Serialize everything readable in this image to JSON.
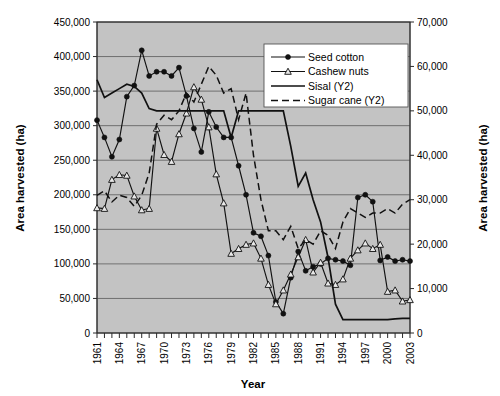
{
  "chart_data": {
    "type": "line",
    "title": "",
    "xlabel": "Year",
    "ylabel": "Area harvested (ha)",
    "y2label": "Area harvested (ha)",
    "ylim": [
      0,
      450000
    ],
    "y2lim": [
      0,
      70000
    ],
    "yticks": [
      "0",
      "50,000",
      "100,000",
      "150,000",
      "200,000",
      "250,000",
      "300,000",
      "350,000",
      "400,000",
      "450,000"
    ],
    "ytick_values": [
      0,
      50000,
      100000,
      150000,
      200000,
      250000,
      300000,
      350000,
      400000,
      450000
    ],
    "y2ticks": [
      "0",
      "10,000",
      "20,000",
      "30,000",
      "40,000",
      "50,000",
      "60,000",
      "70,000"
    ],
    "y2tick_values": [
      0,
      10000,
      20000,
      30000,
      40000,
      50000,
      60000,
      70000
    ],
    "grid": true,
    "legend_position": "top-right",
    "xlim": [
      1961,
      2003
    ],
    "x": [
      1961,
      1962,
      1963,
      1964,
      1965,
      1966,
      1967,
      1968,
      1969,
      1970,
      1971,
      1972,
      1973,
      1974,
      1975,
      1976,
      1977,
      1978,
      1979,
      1980,
      1981,
      1982,
      1983,
      1984,
      1985,
      1986,
      1987,
      1988,
      1989,
      1990,
      1991,
      1992,
      1993,
      1994,
      1995,
      1996,
      1997,
      1998,
      1999,
      2000,
      2001,
      2002,
      2003
    ],
    "xtick_labels": [
      "1961",
      "1964",
      "1967",
      "1970",
      "1973",
      "1976",
      "1979",
      "1982",
      "1985",
      "1988",
      "1991",
      "1994",
      "1997",
      "2000",
      "2003"
    ],
    "xtick_label_values": [
      1961,
      1964,
      1967,
      1970,
      1973,
      1976,
      1979,
      1982,
      1985,
      1988,
      1991,
      1994,
      1997,
      2000,
      2003
    ],
    "series": [
      {
        "name": "Seed cotton",
        "axis": "y1",
        "marker": "filled-circle",
        "linestyle": "solid",
        "values": [
          308000,
          283000,
          255000,
          280000,
          342000,
          358000,
          409000,
          372000,
          378000,
          378000,
          372000,
          384000,
          343000,
          296000,
          262000,
          320000,
          298000,
          283000,
          283000,
          242000,
          200000,
          145000,
          140000,
          112000,
          45000,
          28000,
          80000,
          118000,
          90000,
          96000,
          100000,
          108000,
          106000,
          104000,
          98000,
          196000,
          200000,
          190000,
          105000,
          110000,
          104000,
          106000,
          104000
        ]
      },
      {
        "name": "Cashew nuts",
        "axis": "y1",
        "marker": "open-triangle",
        "linestyle": "solid",
        "values": [
          181000,
          180000,
          222000,
          229000,
          228000,
          198000,
          178000,
          180000,
          296000,
          258000,
          248000,
          288000,
          318000,
          356000,
          338000,
          298000,
          230000,
          188000,
          115000,
          122000,
          128000,
          130000,
          108000,
          70000,
          42000,
          62000,
          85000,
          110000,
          135000,
          88000,
          102000,
          72000,
          70000,
          78000,
          108000,
          120000,
          130000,
          122000,
          128000,
          60000,
          62000,
          46000,
          48000
        ]
      },
      {
        "name": "Sisal (Y2)",
        "axis": "y2",
        "marker": "none",
        "linestyle": "solid",
        "values": [
          57000,
          53000,
          54000,
          55000,
          56000,
          55500,
          54000,
          50500,
          50000,
          50000,
          50000,
          50000,
          50000,
          50000,
          50000,
          50000,
          50000,
          50000,
          44000,
          50000,
          50000,
          50000,
          50000,
          50000,
          50000,
          50000,
          42000,
          33000,
          36000,
          30000,
          25000,
          17000,
          6500,
          3000,
          3000,
          3000,
          3000,
          3000,
          3000,
          3000,
          3200,
          3300,
          3300
        ]
      },
      {
        "name": "Sugar cane (Y2)",
        "axis": "y2",
        "marker": "none",
        "linestyle": "dashed",
        "values": [
          31000,
          32000,
          29500,
          31000,
          30500,
          28500,
          31000,
          36000,
          47000,
          49000,
          48000,
          50000,
          54000,
          52000,
          56000,
          60000,
          58000,
          54000,
          55000,
          48000,
          54000,
          40000,
          30000,
          23000,
          23000,
          21000,
          24000,
          19000,
          21000,
          20000,
          23000,
          22000,
          19000,
          25000,
          28000,
          27000,
          26000,
          27000,
          27000,
          28000,
          27000,
          29000,
          30000
        ]
      }
    ]
  },
  "legend": {
    "items": [
      {
        "label": "Seed cotton"
      },
      {
        "label": "Cashew nuts"
      },
      {
        "label": "Sisal (Y2)"
      },
      {
        "label": "Sugar cane (Y2)"
      }
    ]
  }
}
